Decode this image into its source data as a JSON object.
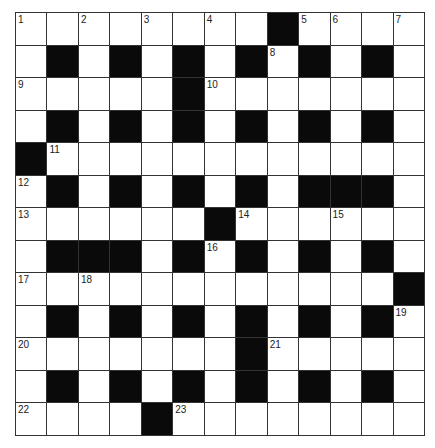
{
  "puzzle": {
    "rows": 13,
    "cols": 13,
    "colors": {
      "block": "#0a0a0a",
      "cell": "#ffffff",
      "line": "#333333",
      "number": "#222222"
    },
    "grid": [
      "WWWWWWWWBWWWW",
      "WBWBWBWBWBWBW",
      "WWWWWBWWWWWWW",
      "WBWBWBWBWBWBW",
      "BWWWWWWWWWWWW",
      "WBWBWBWBWBBBW",
      "WWWWWWBWWWWWW",
      "WBBBWBWBWBWBW",
      "WWWWWWWWWWWWB",
      "WBWBWBWBWBWBW",
      "WWWWWWWBWWWWW",
      "WBWBWBWBWBWBW",
      "WWWWBWWWWWWWW"
    ],
    "numbers": [
      {
        "row": 0,
        "col": 0,
        "n": "1"
      },
      {
        "row": 0,
        "col": 2,
        "n": "2"
      },
      {
        "row": 0,
        "col": 4,
        "n": "3"
      },
      {
        "row": 0,
        "col": 6,
        "n": "4"
      },
      {
        "row": 0,
        "col": 9,
        "n": "5"
      },
      {
        "row": 0,
        "col": 10,
        "n": "6"
      },
      {
        "row": 0,
        "col": 12,
        "n": "7"
      },
      {
        "row": 1,
        "col": 8,
        "n": "8"
      },
      {
        "row": 2,
        "col": 0,
        "n": "9"
      },
      {
        "row": 2,
        "col": 6,
        "n": "10"
      },
      {
        "row": 4,
        "col": 1,
        "n": "11"
      },
      {
        "row": 5,
        "col": 0,
        "n": "12"
      },
      {
        "row": 6,
        "col": 0,
        "n": "13"
      },
      {
        "row": 6,
        "col": 7,
        "n": "14"
      },
      {
        "row": 6,
        "col": 10,
        "n": "15"
      },
      {
        "row": 7,
        "col": 6,
        "n": "16"
      },
      {
        "row": 8,
        "col": 0,
        "n": "17"
      },
      {
        "row": 8,
        "col": 2,
        "n": "18"
      },
      {
        "row": 9,
        "col": 12,
        "n": "19"
      },
      {
        "row": 10,
        "col": 0,
        "n": "20"
      },
      {
        "row": 10,
        "col": 8,
        "n": "21"
      },
      {
        "row": 12,
        "col": 0,
        "n": "22"
      },
      {
        "row": 12,
        "col": 5,
        "n": "23"
      }
    ]
  }
}
